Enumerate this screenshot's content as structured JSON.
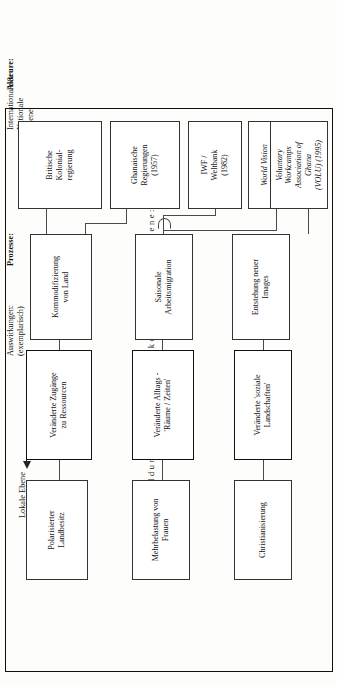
{
  "figure": {
    "orientation": "rotated-90-ccw",
    "caption_spaced": "Ausbildung neuer Handlungskontexte auf Dorfebene:"
  },
  "headers": {
    "actors_label": "Akteure:",
    "actors_scope": "Internationale &\nNationale\nEbene",
    "processes_label": "Prozesse:",
    "effects_label": "Auswirkungen:\n(exemplarisch)",
    "local_level_label": "Lokale Ebene",
    "arrow_icon": "arrow-left-icon"
  },
  "columns": {
    "actors": {
      "name": "actors-column",
      "boxes": [
        {
          "id": "britische-kolonialregierung",
          "text": "Britische\nKolonial-\nregierung",
          "italic": false
        },
        {
          "id": "ghanaische-regierungen",
          "text": "Ghanaische\nRegierungen\n(1957)",
          "italic": false
        },
        {
          "id": "iwf-weltbank",
          "text": "IWF /\nWeltbank\n(1982)",
          "italic": false
        },
        {
          "id": "world-vision-international",
          "text": "World Vision\nInternational\n(1986)",
          "italic": true
        },
        {
          "id": "volu",
          "text": "Voluntary\nWorkcamps\nAssociation of\nGhana\n(VOLU) (1995)",
          "italic": true
        }
      ]
    },
    "processes": {
      "name": "processes-column",
      "boxes": [
        {
          "id": "kommodifizierung-von-land",
          "text": "Kommodifizierung\nvon Land"
        },
        {
          "id": "saisonale-arbeitsmigration",
          "text": "Saisonale\nArbeitsmigration"
        },
        {
          "id": "entstehung-neuer-images",
          "text": "Entstehung neuer\nImages"
        }
      ]
    },
    "contexts": {
      "name": "contexts-column",
      "boxes": [
        {
          "id": "veraenderte-zugaenge-zu-ressourcen",
          "text": "Veränderte Zugänge\nzu Ressourcen"
        },
        {
          "id": "veraenderte-alltags-raeume-zeiten",
          "text": "Veränderte Alltags -\n'Räume / Zeiten'"
        },
        {
          "id": "veraenderte-soziale-landschaften",
          "text": "Veränderte 'soziale\nLandschaften'"
        }
      ]
    },
    "effects": {
      "name": "effects-column",
      "boxes": [
        {
          "id": "polarisierter-landbesitz",
          "text": "Polarisierter\nLandbesitz"
        },
        {
          "id": "mehrbelastung-von-frauen",
          "text": "Mehrbelastung von\nFrauen"
        },
        {
          "id": "christianisierung",
          "text": "Christianisierung"
        }
      ]
    }
  },
  "colors": {
    "ink": "#111111",
    "line": "#4a4a4a",
    "paper": "#fdfdfb"
  }
}
